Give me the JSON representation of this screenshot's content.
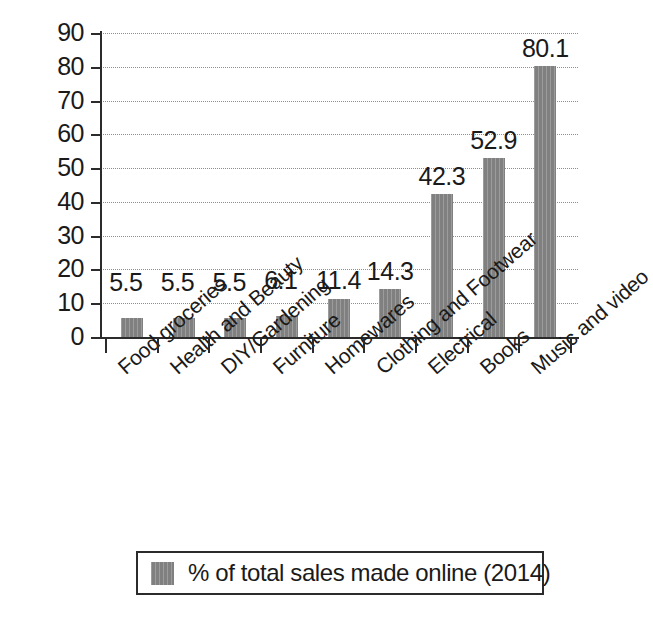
{
  "chart_data": {
    "type": "bar",
    "title": "",
    "subtitle": "",
    "xlabel": "",
    "ylabel": "",
    "ylim": [
      0,
      90
    ],
    "ytick_step": 10,
    "yticks": [
      "0",
      "10",
      "20",
      "30",
      "40",
      "50",
      "60",
      "70",
      "80",
      "90"
    ],
    "grid": true,
    "grid_style": "dotted-horizontal",
    "legend_position": "bottom",
    "categories": [
      "Food groceries",
      "Health and Beauty",
      "DIY/Gardening",
      "Furniture",
      "Homewares",
      "Clothing and Footwear",
      "Electrical",
      "Books",
      "Music and video"
    ],
    "values": [
      5.5,
      5.5,
      5.5,
      6.1,
      11.4,
      14.3,
      42.3,
      52.9,
      80.1
    ],
    "value_labels": [
      "5.5",
      "5.5",
      "5.5",
      "6.1",
      "11.4",
      "14.3",
      "42.3",
      "52.9",
      "80.1"
    ],
    "series": [
      {
        "name": "% of total sales made online (2014)",
        "values": [
          5.5,
          5.5,
          5.5,
          6.1,
          11.4,
          14.3,
          42.3,
          52.9,
          80.1
        ],
        "color": "#808080"
      }
    ],
    "legend": [
      {
        "label": "% of total sales made online (2014)",
        "color": "#808080"
      }
    ],
    "colors": {
      "bar": "#808080",
      "axis": "#2b2b2b",
      "gridline": "#8e8e8e",
      "text": "#1a1a1a",
      "background": "#ffffff"
    },
    "category_label_rotation_deg": -41
  }
}
